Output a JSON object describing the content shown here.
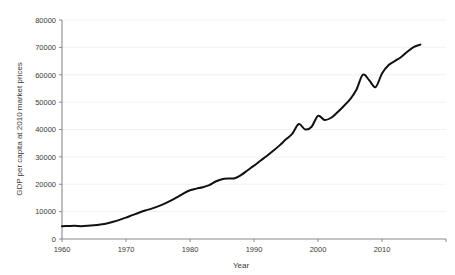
{
  "chart_data": {
    "type": "line",
    "title": "",
    "xlabel": "Year",
    "ylabel": "GDP per capita at 2010 market prices",
    "xlim": [
      1960,
      2020
    ],
    "ylim": [
      0,
      80000
    ],
    "grid": true,
    "legend": false,
    "legend_position": "none",
    "line_color": "#111111",
    "x_tick_labels": [
      "1960",
      "1970",
      "1980",
      "1990",
      "2000",
      "2010"
    ],
    "x_ticks": [
      1960,
      1970,
      1980,
      1990,
      2000,
      2010
    ],
    "y_tick_labels": [
      "0",
      "10000",
      "20000",
      "30000",
      "40000",
      "50000",
      "60000",
      "70000",
      "80000"
    ],
    "y_ticks": [
      0,
      10000,
      20000,
      30000,
      40000,
      50000,
      60000,
      70000,
      80000
    ],
    "series": [
      {
        "name": "GDP per capita at 2010 market prices",
        "x": [
          1960,
          1961,
          1962,
          1963,
          1964,
          1965,
          1966,
          1967,
          1968,
          1969,
          1970,
          1971,
          1972,
          1973,
          1974,
          1975,
          1976,
          1977,
          1978,
          1979,
          1980,
          1981,
          1982,
          1983,
          1984,
          1985,
          1986,
          1987,
          1988,
          1989,
          1990,
          1991,
          1992,
          1993,
          1994,
          1995,
          1996,
          1997,
          1998,
          1999,
          2000,
          2001,
          2002,
          2003,
          2004,
          2005,
          2006,
          2007,
          2008,
          2009,
          2010,
          2011,
          2012,
          2013,
          2014,
          2015,
          2016
        ],
        "values": [
          4700,
          4750,
          4800,
          4700,
          4800,
          5000,
          5300,
          5700,
          6300,
          7000,
          7800,
          8700,
          9600,
          10400,
          11100,
          11900,
          12900,
          14000,
          15300,
          16700,
          17800,
          18400,
          18900,
          19700,
          21000,
          21800,
          22100,
          22200,
          23400,
          25100,
          26800,
          28600,
          30300,
          32200,
          34200,
          36400,
          38500,
          42000,
          40000,
          41000,
          45000,
          43500,
          44200,
          46200,
          48500,
          51000,
          54500,
          60000,
          58000,
          55500,
          60500,
          63500,
          65000,
          66500,
          68500,
          70200,
          71000
        ]
      }
    ]
  },
  "axis": {
    "x_title": "Year",
    "y_title": "GDP per capita at 2010 market prices"
  }
}
